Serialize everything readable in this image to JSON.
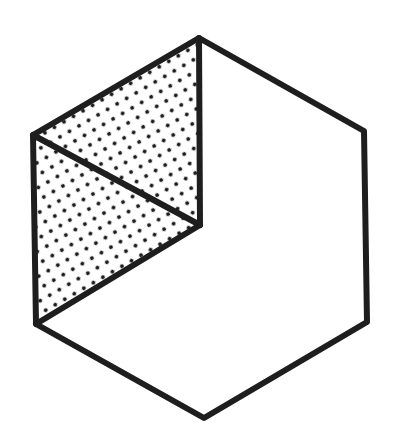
{
  "diagram": {
    "type": "isometric-hexagon",
    "colors": {
      "stroke": "#1e1e1e",
      "fill": "#ffffff",
      "dots": "#1e1e1e"
    },
    "vertices": {
      "top": [
        199,
        38
      ],
      "upper_right": [
        364,
        131
      ],
      "lower_right": [
        367,
        322
      ],
      "bottom": [
        204,
        418
      ],
      "lower_left": [
        36,
        324
      ],
      "upper_left": [
        33,
        135
      ],
      "center": [
        200,
        225
      ]
    },
    "shaded_region": "top, upper_left, lower_left, center",
    "internal_lines": [
      [
        "top",
        "center"
      ],
      [
        "lower_left",
        "center"
      ],
      [
        "upper_left",
        "center"
      ]
    ]
  }
}
